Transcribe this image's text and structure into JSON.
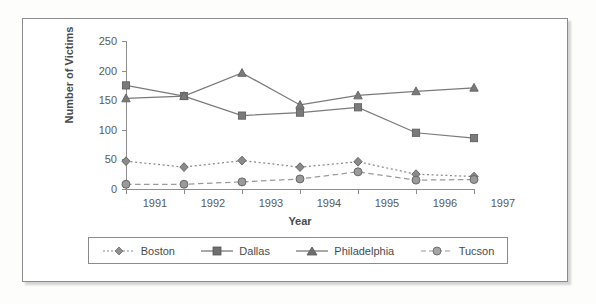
{
  "chart_data": {
    "type": "line",
    "title": "",
    "xlabel": "Year",
    "ylabel": "Number of Victims",
    "categories": [
      "1991",
      "1992",
      "1993",
      "1994",
      "1995",
      "1996",
      "1997"
    ],
    "x": [
      1991,
      1992,
      1993,
      1994,
      1995,
      1996,
      1997
    ],
    "ylim": [
      0,
      250
    ],
    "yticks": [
      0,
      50,
      100,
      150,
      200,
      250
    ],
    "ytick_labels": [
      "0",
      "50",
      "100",
      "150",
      "200",
      "250"
    ],
    "grid": false,
    "legend_position": "bottom",
    "series": [
      {
        "name": "Boston",
        "values": [
          47,
          37,
          48,
          37,
          46,
          25,
          21
        ],
        "marker": "diamond",
        "line_style": "dotted",
        "color": "#8a8a8a"
      },
      {
        "name": "Dallas",
        "values": [
          175,
          157,
          124,
          129,
          138,
          95,
          86
        ],
        "marker": "square",
        "line_style": "solid",
        "color": "#7a7a7a"
      },
      {
        "name": "Philadelphia",
        "values": [
          153,
          157,
          196,
          142,
          158,
          165,
          171
        ],
        "marker": "triangle",
        "line_style": "solid",
        "color": "#7a7a7a"
      },
      {
        "name": "Tucson",
        "values": [
          8,
          8,
          12,
          17,
          29,
          15,
          16
        ],
        "marker": "circle",
        "line_style": "dashed",
        "color": "#9a9a9a"
      }
    ]
  },
  "legend": {
    "entries": [
      {
        "label": "Boston"
      },
      {
        "label": "Dallas"
      },
      {
        "label": "Philadelphia"
      },
      {
        "label": "Tucson"
      }
    ]
  },
  "axes": {
    "y_title": "Number of Victims",
    "x_title": "Year",
    "y_labels": [
      "250",
      "200",
      "150",
      "100",
      "50",
      "0"
    ],
    "x_labels": [
      "1991",
      "1992",
      "1993",
      "1994",
      "1995",
      "1996",
      "1997"
    ]
  },
  "colors": {
    "frame": "#8b8b8b",
    "axis": "#8e8e8e",
    "text": "#4a4a4a",
    "plot_background": "#ffffff"
  }
}
